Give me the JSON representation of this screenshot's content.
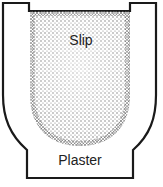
{
  "diagram": {
    "labels": {
      "slip": "Slip",
      "plaster": "Plaster"
    },
    "colors": {
      "outline": "#1a1a1a",
      "stipple": "#555555",
      "background": "#ffffff"
    }
  }
}
